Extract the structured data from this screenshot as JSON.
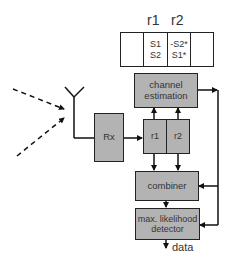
{
  "diagram": {
    "type": "alamouti-receiver-block-diagram",
    "header": {
      "labels": [
        "r1",
        "r2"
      ]
    },
    "code_table": {
      "columns": [
        {
          "rows": []
        },
        {
          "rows": [
            "S1",
            "S2"
          ]
        },
        {
          "rows": [
            "-S2*",
            "S1*"
          ]
        },
        {
          "rows": []
        }
      ]
    },
    "blocks": {
      "rx": "Rx",
      "channel_estimation": "channel estimation",
      "buffer": [
        "r1",
        "r2"
      ],
      "combiner": "combiner",
      "detector": "max. likelihood detector"
    },
    "output_label": "data",
    "icons": {
      "antenna": "antenna-icon",
      "incoming_signals": "dashed-arrow-icon"
    },
    "colors": {
      "block_fill": "#b3b3b3",
      "line": "#222222",
      "background": "#ffffff"
    }
  }
}
